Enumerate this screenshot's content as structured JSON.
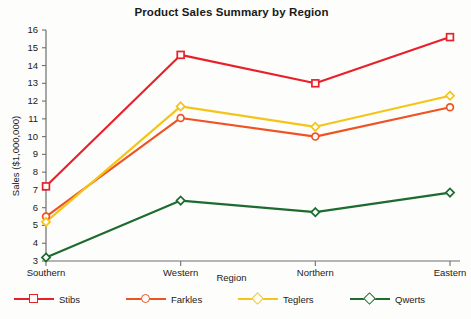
{
  "chart_data": {
    "type": "line",
    "title": "Product Sales Summary by Region",
    "xlabel": "Region",
    "ylabel": "Sales ($1,000,000)",
    "categories": [
      "Southern",
      "Western",
      "Northern",
      "Eastern"
    ],
    "ylim": [
      3,
      16
    ],
    "yticks": [
      3,
      4,
      5,
      6,
      7,
      8,
      9,
      10,
      11,
      12,
      13,
      14,
      15,
      16
    ],
    "grid": false,
    "legend_position": "bottom",
    "series": [
      {
        "name": "Stibs",
        "color": "#e8202a",
        "marker": "square",
        "values": [
          7.2,
          14.6,
          13.0,
          15.6
        ]
      },
      {
        "name": "Farkles",
        "color": "#ef5323",
        "marker": "circle",
        "values": [
          5.5,
          11.05,
          10.0,
          11.65
        ]
      },
      {
        "name": "Teglers",
        "color": "#f5c417",
        "marker": "diamond",
        "values": [
          5.2,
          11.7,
          10.55,
          12.3
        ]
      },
      {
        "name": "Qwerts",
        "color": "#1d6b2f",
        "marker": "diamond",
        "values": [
          3.2,
          6.4,
          5.75,
          6.85
        ]
      }
    ]
  },
  "axis": {
    "axis_color": "#6e6e6e",
    "text_color": "#1a1a1a"
  }
}
